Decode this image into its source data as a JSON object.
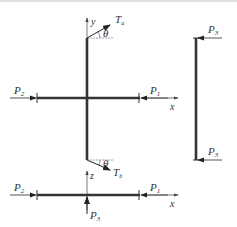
{
  "diagram": {
    "labels": {
      "y_axis": "y",
      "x_axis_top": "x",
      "x_axis_bottom": "x",
      "z_axis": "z",
      "tension_top": "T",
      "tension_top_sub": "a",
      "tension_bottom": "T",
      "tension_bottom_sub": "b",
      "theta_top": "θ",
      "theta_bottom": "θ",
      "p1_top": "P",
      "p1_top_sub": "1",
      "p2_top": "P",
      "p2_top_sub": "2",
      "p1_bottom": "P",
      "p1_bottom_sub": "1",
      "p2_bottom": "P",
      "p2_bottom_sub": "2",
      "p3_bottom": "P",
      "p3_bottom_sub": "3",
      "p3_right_top": "P",
      "p3_right_top_sub": "3",
      "p3_right_bottom": "P",
      "p3_right_bottom_sub": "3"
    },
    "colors": {
      "line": "#333333",
      "thin_line": "#555555",
      "background": "#ffffff"
    }
  }
}
